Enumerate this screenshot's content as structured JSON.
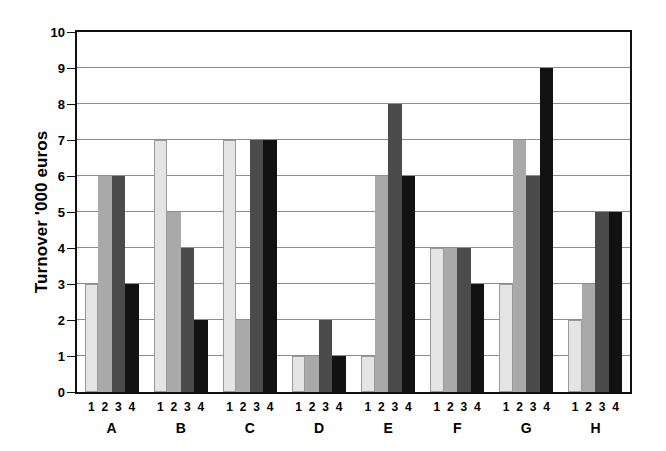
{
  "chart_data": {
    "type": "bar",
    "title": "",
    "subtitle": "",
    "xlabel": "",
    "ylabel": "Turnover '000 euros",
    "ylim": [
      0,
      10
    ],
    "ytick_labels": [
      "0",
      "1",
      "2",
      "3",
      "4",
      "5",
      "6",
      "7",
      "8",
      "9",
      "10"
    ],
    "grid": true,
    "legend": "none",
    "categories": [
      "A",
      "B",
      "C",
      "D",
      "E",
      "F",
      "G",
      "H"
    ],
    "series_tick_labels": [
      "1",
      "2",
      "3",
      "4"
    ],
    "series": [
      {
        "name": "1",
        "color": "#e4e4e4",
        "values": [
          3,
          7,
          7,
          1,
          1,
          4,
          3,
          2
        ]
      },
      {
        "name": "2",
        "color": "#a9a9a9",
        "values": [
          6,
          5,
          2,
          1,
          6,
          4,
          7,
          3
        ]
      },
      {
        "name": "3",
        "color": "#4b4b4b",
        "values": [
          6,
          4,
          7,
          2,
          8,
          4,
          6,
          5
        ]
      },
      {
        "name": "4",
        "color": "#121212",
        "values": [
          3,
          2,
          7,
          1,
          6,
          3,
          9,
          5
        ]
      }
    ],
    "axis_color": "#111111",
    "gridline_color": "#8d8d8d",
    "background_color": "#ffffff"
  }
}
